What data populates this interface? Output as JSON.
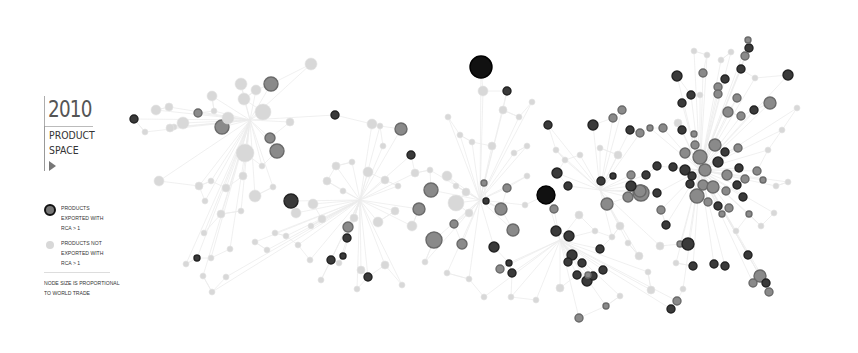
{
  "legend": {
    "year": "2010",
    "title_line1": "PRODUCT",
    "title_line2": "SPACE",
    "play_icon": "triangle-right",
    "rca_yes": "PRODUCTS EXPORTED WITH RCA > 1",
    "rca_no": "PRODUCTS NOT EXPORTED WITH RCA > 1",
    "note": "NODE SIZE IS PROPORTIONAL TO WORLD TRADE"
  },
  "colors": {
    "edge": "#ececec",
    "node_light": "#d8d8d8",
    "node_mid": "#8a8a8a",
    "node_dark": "#3a3a3a",
    "node_black": "#111111"
  },
  "nodes": [
    [
      481,
      67,
      11,
      "k"
    ],
    [
      507,
      91,
      4,
      "d"
    ],
    [
      483,
      91,
      5,
      "l"
    ],
    [
      548,
      125,
      4,
      "d"
    ],
    [
      593,
      125,
      5,
      "d"
    ],
    [
      613,
      118,
      4,
      "m"
    ],
    [
      622,
      110,
      4,
      "m"
    ],
    [
      241,
      84,
      6,
      "l"
    ],
    [
      271,
      84,
      7,
      "m"
    ],
    [
      256,
      90,
      5,
      "l"
    ],
    [
      244,
      99,
      6,
      "l"
    ],
    [
      263,
      112,
      8,
      "l"
    ],
    [
      222,
      127,
      7,
      "m"
    ],
    [
      228,
      118,
      6,
      "l"
    ],
    [
      245,
      153,
      9,
      "l"
    ],
    [
      270,
      138,
      5,
      "m"
    ],
    [
      277,
      151,
      7,
      "m"
    ],
    [
      290,
      122,
      4,
      "l"
    ],
    [
      311,
      64,
      6,
      "l"
    ],
    [
      212,
      96,
      5,
      "l"
    ],
    [
      156,
      110,
      5,
      "l"
    ],
    [
      169,
      107,
      4,
      "l"
    ],
    [
      183,
      123,
      6,
      "l"
    ],
    [
      174,
      127,
      3,
      "l"
    ],
    [
      134,
      119,
      4,
      "d"
    ],
    [
      145,
      132,
      3,
      "l"
    ],
    [
      159,
      181,
      5,
      "l"
    ],
    [
      170,
      128,
      4,
      "l"
    ],
    [
      198,
      113,
      4,
      "m"
    ],
    [
      214,
      111,
      3,
      "l"
    ],
    [
      335,
      115,
      4,
      "d"
    ],
    [
      372,
      124,
      5,
      "l"
    ],
    [
      401,
      129,
      6,
      "m"
    ],
    [
      380,
      126,
      3,
      "l"
    ],
    [
      411,
      155,
      4,
      "d"
    ],
    [
      383,
      146,
      3,
      "l"
    ],
    [
      291,
      201,
      7,
      "d"
    ],
    [
      431,
      190,
      7,
      "m"
    ],
    [
      419,
      209,
      6,
      "m"
    ],
    [
      434,
      240,
      8,
      "m"
    ],
    [
      454,
      224,
      4,
      "m"
    ],
    [
      462,
      244,
      5,
      "m"
    ],
    [
      486,
      201,
      3,
      "d"
    ],
    [
      484,
      183,
      3,
      "m"
    ],
    [
      501,
      209,
      6,
      "m"
    ],
    [
      507,
      188,
      4,
      "m"
    ],
    [
      546,
      195,
      9,
      "k"
    ],
    [
      557,
      173,
      5,
      "d"
    ],
    [
      568,
      186,
      4,
      "d"
    ],
    [
      607,
      204,
      6,
      "m"
    ],
    [
      628,
      197,
      5,
      "m"
    ],
    [
      641,
      193,
      8,
      "m"
    ],
    [
      579,
      215,
      4,
      "l"
    ],
    [
      554,
      209,
      4,
      "m"
    ],
    [
      494,
      247,
      5,
      "d"
    ],
    [
      500,
      269,
      4,
      "m"
    ],
    [
      509,
      263,
      3,
      "d"
    ],
    [
      513,
      230,
      6,
      "m"
    ],
    [
      512,
      273,
      4,
      "d"
    ],
    [
      556,
      231,
      5,
      "d"
    ],
    [
      569,
      236,
      5,
      "d"
    ],
    [
      572,
      255,
      5,
      "d"
    ],
    [
      582,
      263,
      4,
      "d"
    ],
    [
      568,
      262,
      4,
      "d"
    ],
    [
      577,
      275,
      4,
      "d"
    ],
    [
      587,
      281,
      5,
      "d"
    ],
    [
      593,
      276,
      4,
      "d"
    ],
    [
      588,
      275,
      3,
      "m"
    ],
    [
      600,
      249,
      4,
      "d"
    ],
    [
      603,
      270,
      4,
      "d"
    ],
    [
      606,
      306,
      3,
      "m"
    ],
    [
      348,
      227,
      5,
      "m"
    ],
    [
      347,
      238,
      4,
      "d"
    ],
    [
      368,
      277,
      4,
      "d"
    ],
    [
      331,
      260,
      4,
      "d"
    ],
    [
      343,
      256,
      3,
      "d"
    ],
    [
      677,
      76,
      5,
      "d"
    ],
    [
      691,
      95,
      4,
      "d"
    ],
    [
      682,
      103,
      4,
      "d"
    ],
    [
      700,
      95,
      3,
      "l"
    ],
    [
      718,
      87,
      4,
      "m"
    ],
    [
      725,
      79,
      4,
      "d"
    ],
    [
      749,
      48,
      4,
      "d"
    ],
    [
      745,
      56,
      4,
      "m"
    ],
    [
      741,
      69,
      4,
      "d"
    ],
    [
      788,
      75,
      5,
      "d"
    ],
    [
      728,
      112,
      5,
      "m"
    ],
    [
      741,
      116,
      4,
      "m"
    ],
    [
      754,
      110,
      4,
      "d"
    ],
    [
      770,
      103,
      6,
      "m"
    ],
    [
      737,
      98,
      4,
      "m"
    ],
    [
      748,
      40,
      3,
      "m"
    ],
    [
      703,
      73,
      4,
      "m"
    ],
    [
      718,
      94,
      4,
      "m"
    ],
    [
      678,
      123,
      4,
      "l"
    ],
    [
      630,
      130,
      4,
      "d"
    ],
    [
      640,
      133,
      4,
      "m"
    ],
    [
      650,
      128,
      3,
      "m"
    ],
    [
      663,
      128,
      4,
      "m"
    ],
    [
      682,
      130,
      4,
      "d"
    ],
    [
      694,
      134,
      3,
      "m"
    ],
    [
      685,
      153,
      5,
      "m"
    ],
    [
      695,
      145,
      4,
      "m"
    ],
    [
      700,
      157,
      7,
      "m"
    ],
    [
      715,
      145,
      6,
      "m"
    ],
    [
      725,
      152,
      4,
      "d"
    ],
    [
      738,
      148,
      4,
      "m"
    ],
    [
      685,
      170,
      5,
      "d"
    ],
    [
      692,
      176,
      4,
      "d"
    ],
    [
      705,
      170,
      6,
      "m"
    ],
    [
      718,
      162,
      5,
      "d"
    ],
    [
      727,
      175,
      5,
      "m"
    ],
    [
      739,
      168,
      4,
      "d"
    ],
    [
      745,
      179,
      4,
      "m"
    ],
    [
      657,
      166,
      4,
      "d"
    ],
    [
      673,
      167,
      4,
      "d"
    ],
    [
      690,
      184,
      4,
      "d"
    ],
    [
      703,
      185,
      5,
      "m"
    ],
    [
      713,
      187,
      6,
      "m"
    ],
    [
      726,
      191,
      4,
      "m"
    ],
    [
      737,
      185,
      4,
      "d"
    ],
    [
      757,
      171,
      4,
      "m"
    ],
    [
      763,
      180,
      3,
      "m"
    ],
    [
      697,
      196,
      7,
      "m"
    ],
    [
      708,
      202,
      4,
      "m"
    ],
    [
      718,
      206,
      4,
      "d"
    ],
    [
      722,
      214,
      3,
      "m"
    ],
    [
      729,
      208,
      4,
      "m"
    ],
    [
      743,
      197,
      4,
      "d"
    ],
    [
      749,
      214,
      3,
      "m"
    ],
    [
      640,
      191,
      6,
      "m"
    ],
    [
      657,
      193,
      4,
      "d"
    ],
    [
      661,
      210,
      4,
      "m"
    ],
    [
      666,
      225,
      4,
      "d"
    ],
    [
      680,
      244,
      3,
      "m"
    ],
    [
      688,
      244,
      6,
      "d"
    ],
    [
      693,
      266,
      4,
      "d"
    ],
    [
      714,
      264,
      4,
      "d"
    ],
    [
      725,
      266,
      4,
      "d"
    ],
    [
      748,
      255,
      4,
      "d"
    ],
    [
      760,
      276,
      6,
      "m"
    ],
    [
      753,
      283,
      4,
      "m"
    ],
    [
      766,
      283,
      4,
      "d"
    ],
    [
      769,
      292,
      4,
      "m"
    ],
    [
      677,
      301,
      4,
      "m"
    ],
    [
      671,
      309,
      4,
      "d"
    ],
    [
      683,
      289,
      3,
      "l"
    ],
    [
      631,
      175,
      4,
      "m"
    ],
    [
      631,
      186,
      5,
      "d"
    ],
    [
      646,
      175,
      4,
      "d"
    ],
    [
      613,
      176,
      3,
      "d"
    ],
    [
      601,
      181,
      4,
      "d"
    ],
    [
      262,
      166,
      3,
      "l"
    ],
    [
      296,
      213,
      5,
      "l"
    ],
    [
      313,
      204,
      5,
      "l"
    ],
    [
      322,
      219,
      4,
      "l"
    ],
    [
      354,
      218,
      4,
      "l"
    ],
    [
      378,
      222,
      5,
      "l"
    ],
    [
      395,
      211,
      4,
      "l"
    ],
    [
      412,
      226,
      5,
      "l"
    ],
    [
      456,
      203,
      8,
      "l"
    ],
    [
      469,
      213,
      4,
      "l"
    ],
    [
      415,
      173,
      4,
      "l"
    ],
    [
      430,
      170,
      3,
      "l"
    ],
    [
      447,
      176,
      5,
      "l"
    ],
    [
      456,
      186,
      3,
      "l"
    ],
    [
      466,
      192,
      4,
      "l"
    ],
    [
      525,
      205,
      3,
      "l"
    ],
    [
      527,
      176,
      3,
      "l"
    ],
    [
      241,
      211,
      3,
      "l"
    ],
    [
      221,
      214,
      4,
      "l"
    ],
    [
      204,
      233,
      3,
      "l"
    ],
    [
      205,
      201,
      3,
      "l"
    ],
    [
      199,
      186,
      4,
      "l"
    ],
    [
      211,
      181,
      3,
      "l"
    ],
    [
      226,
      188,
      4,
      "l"
    ],
    [
      243,
      176,
      4,
      "l"
    ],
    [
      255,
      196,
      6,
      "l"
    ],
    [
      273,
      187,
      3,
      "l"
    ],
    [
      275,
      233,
      3,
      "l"
    ],
    [
      267,
      250,
      3,
      "l"
    ],
    [
      255,
      242,
      3,
      "l"
    ],
    [
      230,
      249,
      3,
      "l"
    ],
    [
      211,
      258,
      3,
      "l"
    ],
    [
      197,
      258,
      3,
      "d"
    ],
    [
      203,
      276,
      3,
      "l"
    ],
    [
      186,
      264,
      3,
      "l"
    ],
    [
      310,
      260,
      3,
      "l"
    ],
    [
      321,
      280,
      3,
      "l"
    ],
    [
      339,
      263,
      3,
      "l"
    ],
    [
      361,
      270,
      4,
      "l"
    ],
    [
      357,
      289,
      3,
      "l"
    ],
    [
      385,
      265,
      4,
      "l"
    ],
    [
      402,
      285,
      3,
      "l"
    ],
    [
      425,
      262,
      3,
      "l"
    ],
    [
      447,
      273,
      3,
      "l"
    ],
    [
      469,
      279,
      3,
      "l"
    ],
    [
      484,
      297,
      3,
      "l"
    ],
    [
      511,
      297,
      3,
      "l"
    ],
    [
      536,
      300,
      3,
      "l"
    ],
    [
      560,
      288,
      4,
      "l"
    ],
    [
      579,
      318,
      4,
      "m"
    ],
    [
      620,
      296,
      3,
      "l"
    ],
    [
      648,
      272,
      3,
      "l"
    ],
    [
      651,
      290,
      4,
      "l"
    ],
    [
      336,
      166,
      4,
      "l"
    ],
    [
      352,
      162,
      3,
      "l"
    ],
    [
      368,
      172,
      5,
      "l"
    ],
    [
      385,
      180,
      4,
      "l"
    ],
    [
      398,
      186,
      3,
      "l"
    ],
    [
      327,
      181,
      4,
      "l"
    ],
    [
      343,
      191,
      3,
      "l"
    ],
    [
      311,
      226,
      3,
      "l"
    ],
    [
      286,
      236,
      3,
      "l"
    ],
    [
      298,
      245,
      3,
      "l"
    ],
    [
      226,
      277,
      3,
      "l"
    ],
    [
      212,
      292,
      3,
      "l"
    ],
    [
      600,
      148,
      3,
      "l"
    ],
    [
      618,
      155,
      4,
      "l"
    ],
    [
      580,
      155,
      3,
      "l"
    ],
    [
      565,
      160,
      3,
      "l"
    ],
    [
      556,
      150,
      3,
      "l"
    ],
    [
      660,
      246,
      4,
      "l"
    ],
    [
      676,
      263,
      3,
      "l"
    ],
    [
      639,
      256,
      4,
      "l"
    ],
    [
      628,
      243,
      3,
      "l"
    ],
    [
      612,
      237,
      3,
      "l"
    ],
    [
      620,
      226,
      4,
      "l"
    ],
    [
      595,
      231,
      3,
      "l"
    ],
    [
      736,
      231,
      3,
      "l"
    ],
    [
      761,
      226,
      3,
      "l"
    ],
    [
      774,
      213,
      3,
      "l"
    ],
    [
      776,
      186,
      3,
      "l"
    ],
    [
      788,
      182,
      3,
      "l"
    ],
    [
      768,
      150,
      3,
      "l"
    ],
    [
      782,
      130,
      3,
      "l"
    ],
    [
      503,
      110,
      4,
      "l"
    ],
    [
      519,
      117,
      3,
      "l"
    ],
    [
      532,
      102,
      3,
      "l"
    ],
    [
      448,
      117,
      3,
      "l"
    ],
    [
      460,
      135,
      3,
      "l"
    ],
    [
      472,
      142,
      3,
      "l"
    ],
    [
      492,
      146,
      4,
      "l"
    ],
    [
      514,
      153,
      3,
      "l"
    ],
    [
      527,
      146,
      3,
      "l"
    ],
    [
      707,
      55,
      3,
      "l"
    ],
    [
      694,
      51,
      3,
      "l"
    ],
    [
      721,
      60,
      3,
      "l"
    ],
    [
      731,
      52,
      3,
      "l"
    ],
    [
      755,
      78,
      3,
      "l"
    ],
    [
      797,
      108,
      3,
      "l"
    ]
  ],
  "edges_hub": [
    [
      360,
      200
    ],
    [
      480,
      200
    ],
    [
      600,
      190
    ],
    [
      700,
      170
    ],
    [
      250,
      120
    ],
    [
      560,
      240
    ]
  ]
}
